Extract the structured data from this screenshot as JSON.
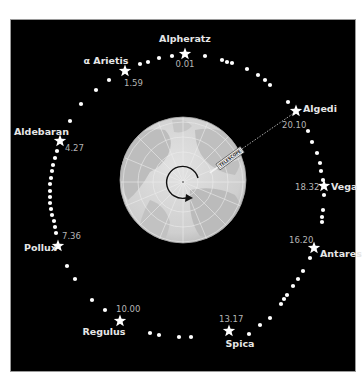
{
  "diagram": {
    "background": "#000000",
    "globe": {
      "center": [
        183,
        180
      ],
      "radius": 63,
      "colors": {
        "ocean": "#d9d9d9",
        "land": "#bdbdbd",
        "grid": "#efefef"
      }
    },
    "telescope": {
      "label": "TELESCOPE",
      "from": [
        214,
        170
      ],
      "to": [
        296,
        111
      ]
    },
    "rotation_arrow": {
      "center": [
        183,
        182
      ],
      "radius": 16
    },
    "stars": [
      {
        "name": "Alpheratz",
        "ra": "0.01",
        "x": 185,
        "y": 54
      },
      {
        "name": "α Arietis",
        "ra": "1.59",
        "x": 125,
        "y": 71
      },
      {
        "name": "Aldebaran",
        "ra": "4.27",
        "x": 60,
        "y": 141
      },
      {
        "name": "Pollux",
        "ra": "7.36",
        "x": 58,
        "y": 246
      },
      {
        "name": "Regulus",
        "ra": "10.00",
        "x": 120,
        "y": 321
      },
      {
        "name": "Spica",
        "ra": "13.17",
        "x": 229,
        "y": 331
      },
      {
        "name": "Antares",
        "ra": "16.20",
        "x": 314,
        "y": 248
      },
      {
        "name": "Vega",
        "ra": "18.32",
        "x": 324,
        "y": 186
      },
      {
        "name": "Algedi",
        "ra": "20.10",
        "x": 296,
        "y": 111
      }
    ],
    "dots": [
      [
        205,
        56
      ],
      [
        222,
        60
      ],
      [
        227,
        62
      ],
      [
        232,
        63
      ],
      [
        247,
        69
      ],
      [
        258,
        75
      ],
      [
        265,
        80
      ],
      [
        270,
        85
      ],
      [
        288,
        102
      ],
      [
        308,
        131
      ],
      [
        312,
        142
      ],
      [
        317,
        153
      ],
      [
        320,
        163
      ],
      [
        321,
        171
      ],
      [
        323,
        180
      ],
      [
        324,
        195
      ],
      [
        323,
        210
      ],
      [
        322,
        217
      ],
      [
        322,
        222
      ],
      [
        310,
        258
      ],
      [
        303,
        271
      ],
      [
        298,
        279
      ],
      [
        293,
        286
      ],
      [
        287,
        295
      ],
      [
        284,
        299
      ],
      [
        281,
        304
      ],
      [
        270,
        318
      ],
      [
        260,
        325
      ],
      [
        249,
        334
      ],
      [
        191,
        337
      ],
      [
        179,
        337
      ],
      [
        159,
        335
      ],
      [
        150,
        333
      ],
      [
        105,
        310
      ],
      [
        92,
        300
      ],
      [
        75,
        279
      ],
      [
        67,
        266
      ],
      [
        56,
        233
      ],
      [
        55,
        227
      ],
      [
        54,
        221
      ],
      [
        52,
        215
      ],
      [
        51,
        209
      ],
      [
        50,
        203
      ],
      [
        50,
        197
      ],
      [
        50,
        191
      ],
      [
        50,
        184
      ],
      [
        51,
        178
      ],
      [
        52,
        171
      ],
      [
        53,
        165
      ],
      [
        55,
        158
      ],
      [
        57,
        151
      ],
      [
        70,
        121
      ],
      [
        81,
        104
      ],
      [
        96,
        90
      ],
      [
        109,
        80
      ],
      [
        140,
        64
      ],
      [
        148,
        62
      ],
      [
        159,
        58
      ],
      [
        172,
        56
      ]
    ]
  }
}
